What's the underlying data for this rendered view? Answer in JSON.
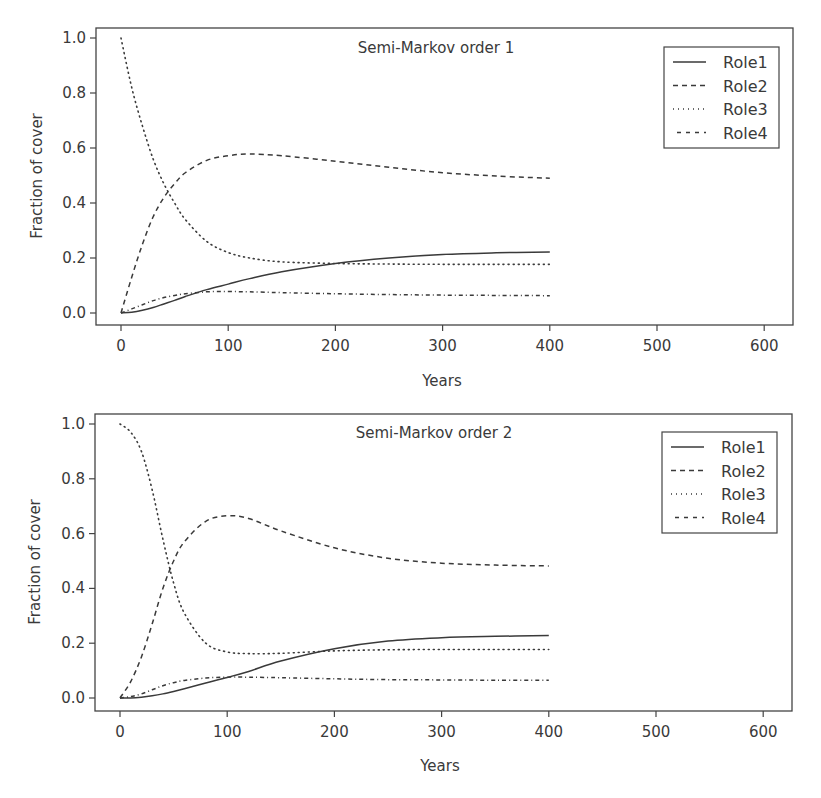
{
  "chart_data": [
    {
      "type": "line",
      "title": "Semi-Markov order 1",
      "xlabel": "Years",
      "ylabel": "Fraction of cover",
      "xlim": [
        -25,
        625
      ],
      "ylim": [
        -0.04,
        1.04
      ],
      "xticks": [
        0,
        100,
        200,
        300,
        400,
        500,
        600
      ],
      "yticks": [
        "0.0",
        "0.2",
        "0.4",
        "0.6",
        "0.8",
        "1.0"
      ],
      "grid": false,
      "legend_position": "top-right",
      "x": [
        0,
        10,
        20,
        30,
        40,
        50,
        60,
        80,
        100,
        120,
        150,
        200,
        250,
        300,
        350,
        400
      ],
      "series": [
        {
          "name": "Role1",
          "style": "solid",
          "values": [
            0.0,
            0.003,
            0.01,
            0.02,
            0.033,
            0.046,
            0.06,
            0.085,
            0.105,
            0.125,
            0.15,
            0.18,
            0.2,
            0.213,
            0.219,
            0.222
          ]
        },
        {
          "name": "Role2",
          "style": "dashed",
          "values": [
            0.0,
            0.13,
            0.25,
            0.35,
            0.42,
            0.47,
            0.51,
            0.555,
            0.572,
            0.578,
            0.572,
            0.552,
            0.53,
            0.51,
            0.498,
            0.49
          ]
        },
        {
          "name": "Role3",
          "style": "dotted",
          "values": [
            1.0,
            0.82,
            0.68,
            0.56,
            0.47,
            0.4,
            0.34,
            0.26,
            0.22,
            0.2,
            0.186,
            0.18,
            0.178,
            0.177,
            0.177,
            0.177
          ]
        },
        {
          "name": "Role4",
          "style": "dashdot",
          "values": [
            0.0,
            0.015,
            0.03,
            0.045,
            0.056,
            0.064,
            0.07,
            0.077,
            0.078,
            0.077,
            0.074,
            0.07,
            0.067,
            0.065,
            0.064,
            0.063
          ]
        }
      ]
    },
    {
      "type": "line",
      "title": "Semi-Markov order 2",
      "xlabel": "Years",
      "ylabel": "Fraction of cover",
      "xlim": [
        -25,
        625
      ],
      "ylim": [
        -0.04,
        1.04
      ],
      "xticks": [
        0,
        100,
        200,
        300,
        400,
        500,
        600
      ],
      "yticks": [
        "0.0",
        "0.2",
        "0.4",
        "0.6",
        "0.8",
        "1.0"
      ],
      "grid": false,
      "legend_position": "top-right",
      "x": [
        0,
        10,
        20,
        30,
        40,
        50,
        60,
        80,
        100,
        120,
        150,
        200,
        250,
        300,
        350,
        400
      ],
      "series": [
        {
          "name": "Role1",
          "style": "solid",
          "values": [
            0.0,
            0.0,
            0.003,
            0.008,
            0.015,
            0.024,
            0.034,
            0.055,
            0.075,
            0.097,
            0.135,
            0.18,
            0.208,
            0.22,
            0.225,
            0.228
          ]
        },
        {
          "name": "Role2",
          "style": "dashed",
          "values": [
            0.0,
            0.06,
            0.15,
            0.27,
            0.4,
            0.5,
            0.57,
            0.645,
            0.665,
            0.655,
            0.61,
            0.548,
            0.51,
            0.492,
            0.485,
            0.482
          ]
        },
        {
          "name": "Role3",
          "style": "dotted",
          "values": [
            1.0,
            0.97,
            0.9,
            0.76,
            0.58,
            0.42,
            0.31,
            0.2,
            0.168,
            0.162,
            0.163,
            0.172,
            0.176,
            0.177,
            0.177,
            0.177
          ]
        },
        {
          "name": "Role4",
          "style": "dashdot",
          "values": [
            0.0,
            0.005,
            0.015,
            0.03,
            0.045,
            0.056,
            0.064,
            0.073,
            0.076,
            0.076,
            0.074,
            0.07,
            0.067,
            0.066,
            0.065,
            0.065
          ]
        }
      ]
    }
  ],
  "panels": [
    {
      "title": "Semi-Markov order 1",
      "xlabel": "Years",
      "ylabel": "Fraction of cover",
      "legend": [
        "Role1",
        "Role2",
        "Role3",
        "Role4"
      ]
    },
    {
      "title": "Semi-Markov order 2",
      "xlabel": "Years",
      "ylabel": "Fraction of cover",
      "legend": [
        "Role1",
        "Role2",
        "Role3",
        "Role4"
      ]
    }
  ],
  "colors": {
    "line": "#3a3a3a",
    "axis": "#444444",
    "background": "#ffffff"
  }
}
